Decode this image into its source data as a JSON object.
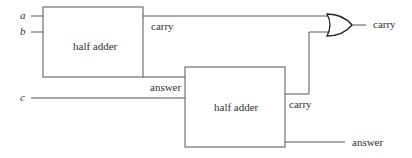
{
  "diagram": {
    "inputs": [
      {
        "id": "a",
        "label": "a"
      },
      {
        "id": "b",
        "label": "b"
      },
      {
        "id": "c",
        "label": "c"
      }
    ],
    "blocks": [
      {
        "id": "ha1",
        "label": "half adder",
        "outputs": {
          "carry": "carry",
          "answer": "answer"
        }
      },
      {
        "id": "ha2",
        "label": "half adder",
        "outputs": {
          "carry": "carry",
          "answer": "answer"
        }
      }
    ],
    "gate": {
      "type": "OR",
      "output_label": "carry"
    },
    "final_answer_label": "answer",
    "colors": {
      "line": "#555555",
      "gate": "#222222",
      "text": "#333333"
    }
  }
}
